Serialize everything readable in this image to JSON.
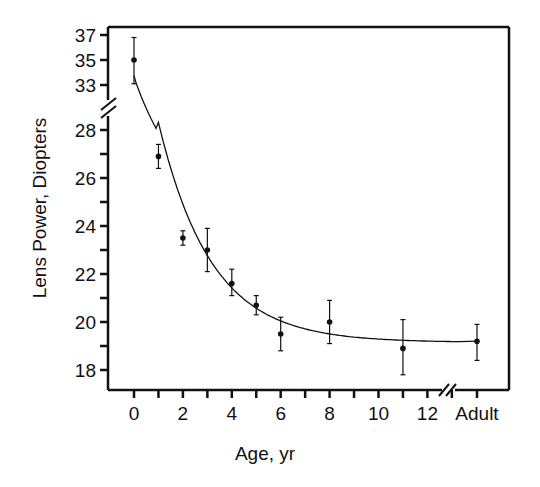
{
  "chart_data": {
    "type": "scatter",
    "title": "",
    "xlabel": "Age, yr",
    "ylabel": "Lens Power, Diopters",
    "x_ticks": [
      {
        "value": 0,
        "label": "0"
      },
      {
        "value": 1,
        "label": ""
      },
      {
        "value": 2,
        "label": "2"
      },
      {
        "value": 3,
        "label": ""
      },
      {
        "value": 4,
        "label": "4"
      },
      {
        "value": 5,
        "label": ""
      },
      {
        "value": 6,
        "label": "6"
      },
      {
        "value": 7,
        "label": ""
      },
      {
        "value": 8,
        "label": "8"
      },
      {
        "value": 9,
        "label": ""
      },
      {
        "value": 10,
        "label": "10"
      },
      {
        "value": 11,
        "label": ""
      },
      {
        "value": 12,
        "label": "12"
      },
      {
        "value": 13,
        "label": ""
      },
      {
        "value": "Adult",
        "label": "Adult"
      }
    ],
    "y_ticks_upper": [
      {
        "value": 37,
        "label": "37"
      },
      {
        "value": 35,
        "label": "35"
      },
      {
        "value": 33,
        "label": "33"
      }
    ],
    "y_ticks_lower": [
      {
        "value": 28,
        "label": "28"
      },
      {
        "value": 27,
        "label": ""
      },
      {
        "value": 26,
        "label": "26"
      },
      {
        "value": 25,
        "label": ""
      },
      {
        "value": 24,
        "label": "24"
      },
      {
        "value": 23,
        "label": ""
      },
      {
        "value": 22,
        "label": "22"
      },
      {
        "value": 21,
        "label": ""
      },
      {
        "value": 20,
        "label": "20"
      },
      {
        "value": 19,
        "label": ""
      },
      {
        "value": 18,
        "label": "18"
      }
    ],
    "axis_breaks": {
      "y": "between 28 and 33",
      "x": "between 13 and Adult"
    },
    "ylim": [
      17.3,
      37.3
    ],
    "grid": false,
    "legend": null,
    "series": [
      {
        "name": "Mean lens power",
        "points": [
          {
            "x": 0,
            "y": 35.0,
            "err_low": 33.1,
            "err_high": 36.8
          },
          {
            "x": 1,
            "y": 26.9,
            "err_low": 26.4,
            "err_high": 27.4
          },
          {
            "x": 2,
            "y": 23.5,
            "err_low": 23.2,
            "err_high": 23.8
          },
          {
            "x": 3,
            "y": 23.0,
            "err_low": 22.1,
            "err_high": 23.9
          },
          {
            "x": 4,
            "y": 21.6,
            "err_low": 21.1,
            "err_high": 22.2
          },
          {
            "x": 5,
            "y": 20.7,
            "err_low": 20.3,
            "err_high": 21.1
          },
          {
            "x": 6,
            "y": 19.5,
            "err_low": 18.8,
            "err_high": 20.2
          },
          {
            "x": 8,
            "y": 20.0,
            "err_low": 19.1,
            "err_high": 20.9
          },
          {
            "x": 11,
            "y": 18.9,
            "err_low": 17.8,
            "err_high": 20.1
          },
          {
            "x": "Adult",
            "y": 19.2,
            "err_low": 18.4,
            "err_high": 19.9
          }
        ]
      },
      {
        "name": "Fitted exponential decay curve",
        "type": "line",
        "points": [
          {
            "x": 0,
            "y": 33.2
          },
          {
            "x": 1,
            "y": 26.3
          },
          {
            "x": 2,
            "y": 23.6
          },
          {
            "x": 3,
            "y": 22.1
          },
          {
            "x": 4,
            "y": 21.2
          },
          {
            "x": 5,
            "y": 20.5
          },
          {
            "x": 6,
            "y": 20.1
          },
          {
            "x": 8,
            "y": 19.6
          },
          {
            "x": 10,
            "y": 19.35
          },
          {
            "x": 11,
            "y": 19.25
          },
          {
            "x": 12,
            "y": 19.2
          },
          {
            "x": "Adult",
            "y": 19.2
          }
        ]
      }
    ]
  }
}
